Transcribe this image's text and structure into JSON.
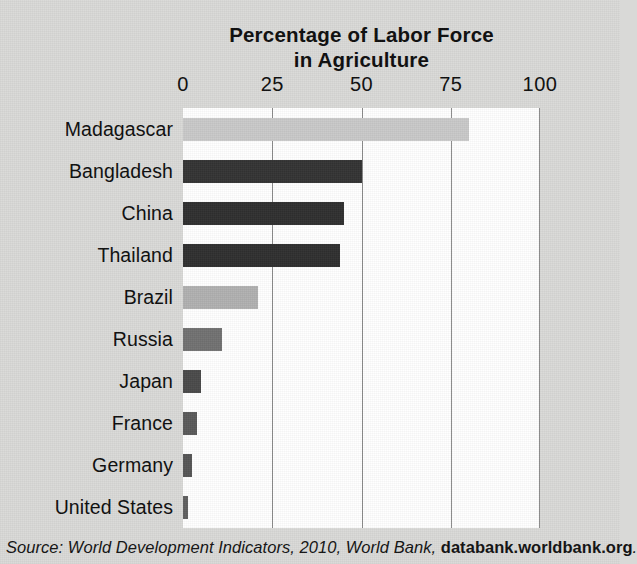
{
  "chart_data": {
    "type": "bar",
    "orientation": "horizontal",
    "title": "Percentage of Labor Force in Agriculture",
    "title_lines": [
      "Percentage of Labor Force",
      "in Agriculture"
    ],
    "xlabel": "",
    "ylabel": "",
    "xlim": [
      0,
      100
    ],
    "xticks": [
      0,
      25,
      50,
      75,
      100
    ],
    "xtick_labels": [
      "0",
      "25",
      "50",
      "75",
      "100"
    ],
    "grid": "vertical",
    "legend": "none",
    "categories": [
      "Madagascar",
      "Bangladesh",
      "China",
      "Thailand",
      "Brazil",
      "Russia",
      "Japan",
      "France",
      "Germany",
      "United States"
    ],
    "values": [
      80,
      50,
      45,
      44,
      21,
      11,
      5,
      4,
      2.5,
      1.5
    ],
    "bar_colors": [
      "#c9c9c9",
      "#333333",
      "#2f2f2f",
      "#2f2f2f",
      "#b0b0b0",
      "#717171",
      "#4a4a4a",
      "#5a5a5a",
      "#555555",
      "#5f5f5f"
    ],
    "bars": [
      {
        "category": "Madagascar",
        "value": 80,
        "color": "#c9c9c9"
      },
      {
        "category": "Bangladesh",
        "value": 50,
        "color": "#333333"
      },
      {
        "category": "China",
        "value": 45,
        "color": "#2f2f2f"
      },
      {
        "category": "Thailand",
        "value": 44,
        "color": "#2f2f2f"
      },
      {
        "category": "Brazil",
        "value": 21,
        "color": "#b0b0b0"
      },
      {
        "category": "Russia",
        "value": 11,
        "color": "#717171"
      },
      {
        "category": "Japan",
        "value": 5,
        "color": "#4a4a4a"
      },
      {
        "category": "France",
        "value": 4,
        "color": "#5a5a5a"
      },
      {
        "category": "Germany",
        "value": 2.5,
        "color": "#555555"
      },
      {
        "category": "United States",
        "value": 1.5,
        "color": "#5f5f5f"
      }
    ],
    "source_note": {
      "text_italic": "Source: World Development Indicators, 2010, World Bank, ",
      "url": "databank.worldbank.org",
      "trailing": "."
    }
  },
  "colors": {
    "page_background": "#d9d9d7",
    "plot_background": "#ffffff",
    "gridline": "#8b8b8b",
    "text": "#0d0d0d"
  }
}
